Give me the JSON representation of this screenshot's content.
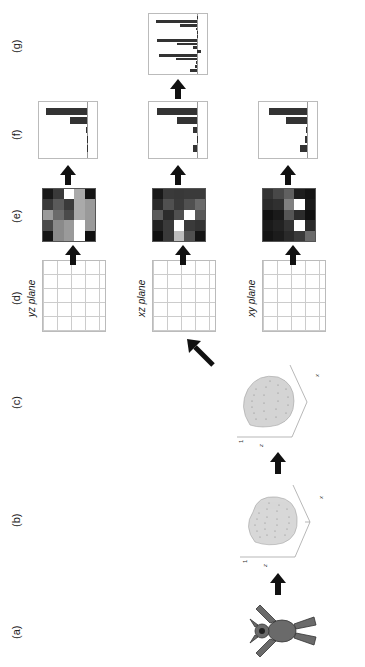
{
  "figure": {
    "orientation": "rotated -90deg",
    "panels": [
      {
        "id": "a",
        "label": "(a)",
        "content": "3D armadillo mesh model"
      },
      {
        "id": "b",
        "label": "(b)",
        "content": "point cloud of model"
      },
      {
        "id": "c",
        "label": "(c)",
        "content": "normalized/aligned point cloud"
      },
      {
        "id": "d",
        "label": "(d)",
        "content": "projections onto planes"
      },
      {
        "id": "e",
        "label": "(e)",
        "content": "5x5 occupancy grids"
      },
      {
        "id": "f",
        "label": "(f)",
        "content": "per-plane feature histograms"
      },
      {
        "id": "g",
        "label": "(g)",
        "content": "concatenated histogram"
      }
    ],
    "plane_labels": {
      "xy": "xy plane",
      "xz": "xz plane",
      "yz": "yz plane"
    },
    "axis3d": {
      "z_ticks": [
        "1",
        "0",
        "-1",
        "1.5"
      ],
      "z_label": "z",
      "y_ticks": [
        "1",
        "0"
      ],
      "y_label": "y",
      "x_ticks": [
        "-1",
        "0",
        "1"
      ],
      "x_label": "x"
    },
    "grid_ticks": [
      "1",
      "2",
      "3",
      "4",
      "5"
    ],
    "heatmaps": {
      "xy": [
        [
          "#141414",
          "#1a1a1a",
          "#111111",
          "#2a2a2a",
          "#333333"
        ],
        [
          "#1c1c1c",
          "#222222",
          "#1a1a1a",
          "#303030",
          "#484848"
        ],
        [
          "#2a2a2a",
          "#333333",
          "#555555",
          "#808080",
          "#606060"
        ],
        [
          "#3a3a3a",
          "#ffffff",
          "#2c2c2c",
          "#ffffff",
          "#1e1e1e"
        ],
        [
          "#6a6a6a",
          "#2a2a2a",
          "#101010",
          "#1a1a1a",
          "#141414"
        ]
      ],
      "xz": [
        [
          "#101010",
          "#222222",
          "#5a5a5a",
          "#2a2a2a",
          "#181818"
        ],
        [
          "#3a3a3a",
          "#3a3a3a",
          "#2c2c2c",
          "#505050",
          "#3a3a3a"
        ],
        [
          "#bdbdbd",
          "#ffffff",
          "#505050",
          "#3a3a3a",
          "#383838"
        ],
        [
          "#505050",
          "#3a3a3a",
          "#ffffff",
          "#505050",
          "#3a3a3a"
        ],
        [
          "#141414",
          "#333333",
          "#585858",
          "#6a6a6a",
          "#3a3a3a"
        ]
      ],
      "yz": [
        [
          "#141414",
          "#4a4a4a",
          "#9a9a9a",
          "#3a3a3a",
          "#181818"
        ],
        [
          "#8a8a8a",
          "#8a8a8a",
          "#6a6a6a",
          "#5a5a5a",
          "#3a3a3a"
        ],
        [
          "#9a9a9a",
          "#9a9a9a",
          "#4a4a4a",
          "#3a3a3a",
          "#ffffff"
        ],
        [
          "#ffffff",
          "#ffffff",
          "#aaaaaa",
          "#aaaaaa",
          "#aaaaaa"
        ],
        [
          "#101010",
          "#9a9a9a",
          "#9a9a9a",
          "#9a9a9a",
          "#141414"
        ]
      ]
    },
    "histogram_axis": {
      "y_ticks": [
        "5",
        "4",
        "3",
        "2",
        "1",
        "0",
        "-1"
      ],
      "x_ticks_5": [
        "1",
        "2",
        "3",
        "4",
        "5"
      ],
      "x_ticks_16": [
        "0",
        "2",
        "4",
        "6",
        "8",
        "10",
        "12",
        "14",
        "16"
      ]
    }
  },
  "chart_data": [
    {
      "type": "bar",
      "title": "xy plane histogram (f)",
      "categories": [
        "1",
        "2",
        "3",
        "4",
        "5"
      ],
      "values": [
        0.8,
        0.2,
        0.1,
        2.2,
        4.0
      ],
      "ylim": [
        -1,
        5
      ]
    },
    {
      "type": "bar",
      "title": "xz plane histogram (f)",
      "categories": [
        "1",
        "2",
        "3",
        "4",
        "5"
      ],
      "values": [
        0.4,
        0.0,
        0.5,
        2.1,
        4.2
      ],
      "ylim": [
        -1,
        5
      ]
    },
    {
      "type": "bar",
      "title": "yz plane histogram (f)",
      "categories": [
        "1",
        "2",
        "3",
        "4",
        "5"
      ],
      "values": [
        0.0,
        0.05,
        0.1,
        1.8,
        4.3
      ],
      "ylim": [
        -1,
        5
      ]
    },
    {
      "type": "bar",
      "title": "concatenated histogram (g)",
      "categories": [
        "1",
        "2",
        "3",
        "4",
        "5",
        "6",
        "7",
        "8",
        "9",
        "10",
        "11",
        "12",
        "13",
        "14",
        "15"
      ],
      "values": [
        0.8,
        0.2,
        0.1,
        2.2,
        4.0,
        -0.4,
        0.5,
        2.1,
        4.2,
        0.0,
        0.05,
        0.1,
        1.8,
        4.3,
        0.0
      ],
      "xlim": [
        0,
        16
      ],
      "ylim": [
        -1,
        5
      ]
    }
  ]
}
